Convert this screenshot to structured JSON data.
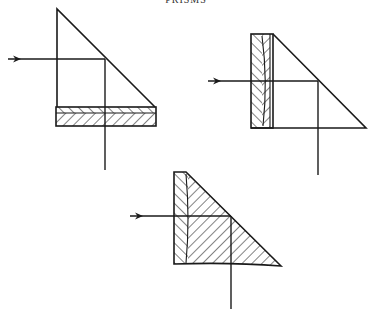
{
  "header": {
    "running_title": "PRISMS"
  },
  "colors": {
    "ink": "#1a1a1a",
    "paper": "#ffffff"
  },
  "figures": [
    {
      "id": "fig-1",
      "description": "Right-angle prism with cemented hatched plate along bottom face; incident ray from left reflects downward at hypotenuse",
      "prism": [
        [
          57,
          9
        ],
        [
          57,
          107
        ],
        [
          155,
          107
        ]
      ],
      "plate": {
        "x": 56,
        "y": 107,
        "w": 100,
        "h": 19,
        "split_y": 113
      },
      "ray": {
        "start": [
          8,
          59
        ],
        "turn": [
          105,
          59
        ],
        "end": [
          105,
          170
        ]
      }
    },
    {
      "id": "fig-2",
      "description": "Right-angle prism with cemented hatched plate along left face; incident ray from left reflects downward at hypotenuse",
      "prism": [
        [
          273,
          34
        ],
        [
          273,
          128
        ],
        [
          366,
          128
        ]
      ],
      "plate": {
        "x": 251,
        "y": 34,
        "w": 22,
        "h": 94,
        "split_x": 262
      },
      "ray": {
        "start": [
          208,
          81
        ],
        "turn": [
          318,
          81
        ],
        "end": [
          318,
          175
        ]
      }
    },
    {
      "id": "fig-3",
      "description": "Fully hatched prism (solid glass) with chevron-hatched left portion; incident ray from left reflects downward",
      "outline": [
        [
          174,
          172
        ],
        [
          186,
          172
        ],
        [
          281,
          266
        ],
        [
          174,
          264
        ]
      ],
      "split_x": 188,
      "ray": {
        "start": [
          130,
          216
        ],
        "turn": [
          231,
          216
        ],
        "end": [
          231,
          309
        ]
      }
    }
  ]
}
